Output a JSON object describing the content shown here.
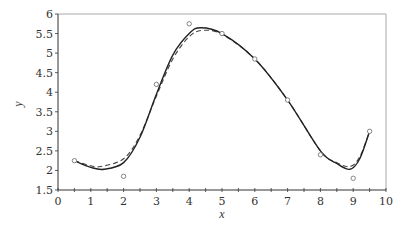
{
  "chart_data": {
    "type": "line",
    "title": "",
    "xlabel": "x",
    "ylabel": "y",
    "xlim": [
      0,
      10
    ],
    "ylim": [
      1.5,
      6
    ],
    "x_ticks": [
      "0",
      "1",
      "2",
      "3",
      "4",
      "5",
      "6",
      "7",
      "8",
      "9",
      "10"
    ],
    "y_ticks": [
      "1.5",
      "2",
      "2.5",
      "3",
      "3.5",
      "4",
      "4.5",
      "5",
      "5.5",
      "6"
    ],
    "grid": false,
    "legend": null,
    "series": [
      {
        "name": "data points",
        "style": "markers (open circles)",
        "x": [
          0.5,
          2,
          3,
          4,
          5,
          6,
          7,
          8,
          9,
          9.5
        ],
        "y": [
          2.25,
          1.85,
          4.2,
          5.75,
          5.5,
          4.85,
          3.8,
          2.4,
          1.8,
          3.0
        ]
      },
      {
        "name": "solid fit",
        "style": "solid line",
        "x": [
          0.5,
          1.0,
          1.4,
          2.0,
          2.5,
          3.0,
          3.5,
          4.0,
          4.35,
          5.0,
          6.0,
          7.0,
          8.0,
          8.5,
          8.9,
          9.2,
          9.5
        ],
        "y": [
          2.25,
          2.08,
          2.03,
          2.2,
          2.85,
          3.95,
          4.95,
          5.5,
          5.65,
          5.5,
          4.85,
          3.8,
          2.5,
          2.18,
          2.03,
          2.3,
          3.0
        ]
      },
      {
        "name": "dashed fit",
        "style": "dashed line",
        "x": [
          0.5,
          1.0,
          1.3,
          2.0,
          2.5,
          3.0,
          3.5,
          4.0,
          4.4,
          5.0,
          6.0,
          7.0,
          8.0,
          8.5,
          8.9,
          9.2,
          9.5
        ],
        "y": [
          2.25,
          2.12,
          2.1,
          2.3,
          2.9,
          3.9,
          4.85,
          5.42,
          5.58,
          5.48,
          4.85,
          3.8,
          2.5,
          2.2,
          2.1,
          2.35,
          3.0
        ]
      }
    ]
  },
  "colors": {
    "axis": "#333333",
    "frame": "#aaaaaa",
    "solid_line": "#222222",
    "dashed_line": "#444444",
    "marker": "#777777"
  }
}
